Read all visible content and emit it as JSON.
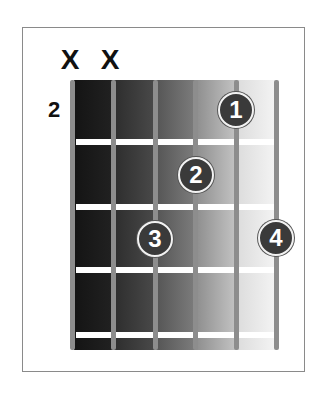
{
  "chord_diagram": {
    "muted_strings": [
      {
        "string": 6,
        "symbol": "X"
      },
      {
        "string": 5,
        "symbol": "X"
      }
    ],
    "start_fret_label": "2",
    "num_strings": 6,
    "num_frets_shown": 4,
    "fingers": [
      {
        "label": "1",
        "string": 2,
        "fret_row": 1
      },
      {
        "label": "2",
        "string": 3,
        "fret_row": 2
      },
      {
        "label": "3",
        "string": 4,
        "fret_row": 3
      },
      {
        "label": "4",
        "string": 1,
        "fret_row": 3
      }
    ],
    "colors": {
      "string": "#8d8d8d",
      "fret": "#ffffff",
      "finger_dot": "#3a3a3a",
      "finger_text": "#ffffff",
      "frame_border": "#8a8a8a",
      "gradient": [
        "#1c1c1c",
        "#3e3e3e",
        "#6e6e6e",
        "#a8a8a8",
        "#e6e6e6"
      ]
    }
  }
}
